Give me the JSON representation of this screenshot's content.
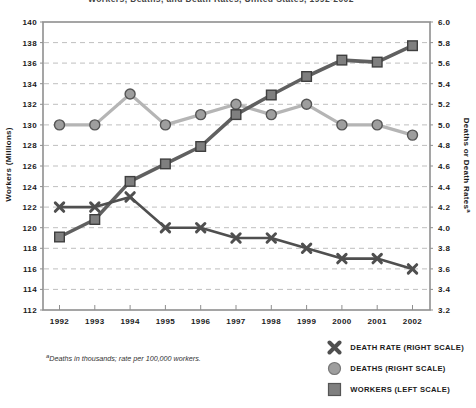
{
  "title": {
    "text": "Workers, Deaths, and Death Rates, United States, 1992-2002",
    "clipped_at_top": true
  },
  "footnote": {
    "marker": "a",
    "text": "Deaths in thousands; rate per 100,000 workers."
  },
  "left_axis": {
    "label": "Workers (Millions)",
    "min": 112,
    "max": 140,
    "step": 2
  },
  "right_axis": {
    "label": "Deaths or Death Rates",
    "superscript": "a",
    "min": 3.2,
    "max": 6.0,
    "step": 0.2
  },
  "legend": {
    "death_rate_label": "DEATH RATE (RIGHT SCALE)",
    "deaths_label": "DEATHS (RIGHT SCALE)",
    "workers_label": "WORKERS (LEFT SCALE)"
  },
  "colors": {
    "background": "#ffffff",
    "frame": "#8f8f8f",
    "grid": "#bfbfbf",
    "text": "#1a1a1a",
    "death_rate_line": "#4f4f4f",
    "deaths_line": "#b5b5b5",
    "deaths_fill": "#9e9e9e",
    "deaths_stroke": "#555555",
    "workers_line": "#606060",
    "workers_fill": "#7f7f7f",
    "workers_stroke": "#3f3f3f"
  },
  "chart_data": {
    "type": "line",
    "categories": [
      "1992",
      "1993",
      "1994",
      "1995",
      "1996",
      "1997",
      "1998",
      "1999",
      "2000",
      "2001",
      "2002"
    ],
    "series": [
      {
        "name": "DEATH RATE (RIGHT SCALE)",
        "axis": "right",
        "marker": "x",
        "values": [
          4.2,
          4.2,
          4.3,
          4.0,
          4.0,
          3.9,
          3.9,
          3.8,
          3.7,
          3.7,
          3.6
        ]
      },
      {
        "name": "DEATHS (RIGHT SCALE)",
        "axis": "right",
        "marker": "circle",
        "values": [
          5.0,
          5.0,
          5.3,
          5.0,
          5.1,
          5.2,
          5.1,
          5.2,
          5.0,
          5.0,
          4.9
        ]
      },
      {
        "name": "WORKERS (LEFT SCALE)",
        "axis": "left",
        "marker": "square",
        "values": [
          119.1,
          120.8,
          124.5,
          126.2,
          127.9,
          131.0,
          132.9,
          134.7,
          136.3,
          136.1,
          137.7
        ]
      }
    ],
    "title": "Workers, Deaths, and Death Rates, United States, 1992-2002",
    "xlabel": "",
    "ylabel_left": "Workers (Millions)",
    "ylabel_right": "Deaths or Death Rates",
    "left_ylim": [
      112,
      140
    ],
    "right_ylim": [
      3.2,
      6.0
    ],
    "grid": "dashed-horizontal",
    "legend_position": "bottom-right"
  }
}
